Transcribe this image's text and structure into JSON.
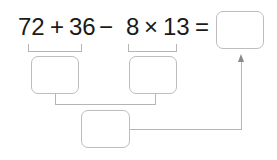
{
  "expression": {
    "a": "72",
    "op1": "+",
    "b": "36",
    "op2": "−",
    "c": "8",
    "op3": "×",
    "d": "13",
    "equals": "="
  },
  "boxes": {
    "sum_box": "",
    "product_box": "",
    "difference_box": "",
    "answer_box": ""
  },
  "colors": {
    "text": "#1a1a1a",
    "box_border": "#bdbdbd",
    "line": "#b5b5b5"
  }
}
